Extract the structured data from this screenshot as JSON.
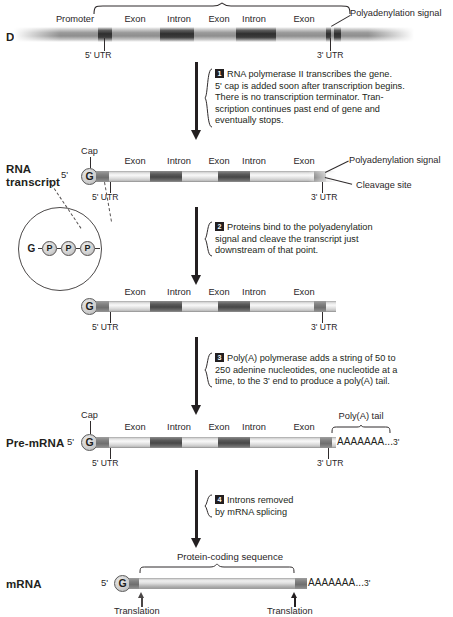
{
  "diagram": {
    "rows": [
      {
        "name": "dna",
        "label": "DNA",
        "segments": [
          "Promoter",
          "Exon",
          "Intron",
          "Exon",
          "Intron",
          "Exon"
        ],
        "utr5": "5' UTR",
        "utr3": "3' UTR",
        "callout_polyA": "Polyadenylation signal"
      },
      {
        "name": "rna-transcript",
        "label_line1": "RNA",
        "label_line2": "transcript",
        "cap_label": "Cap",
        "cap_letter": "G",
        "five_prime": "5'",
        "segments": [
          "Exon",
          "Intron",
          "Exon",
          "Intron",
          "Exon"
        ],
        "utr5": "5' UTR",
        "utr3": "3' UTR",
        "callout_polyA": "Polyadenylation signal",
        "callout_cleavage": "Cleavage site",
        "inset": [
          "G",
          "P",
          "P",
          "P"
        ]
      },
      {
        "name": "cleaved-transcript",
        "label": "",
        "cap_letter": "G",
        "segments": [
          "Exon",
          "Intron",
          "Exon",
          "Intron",
          "Exon"
        ],
        "utr5": "5' UTR",
        "utr3": "3' UTR"
      },
      {
        "name": "pre-mrna",
        "label": "Pre-mRNA",
        "cap_label": "Cap",
        "cap_letter": "G",
        "five_prime": "5'",
        "segments": [
          "Exon",
          "Intron",
          "Exon",
          "Intron",
          "Exon"
        ],
        "utr5": "5' UTR",
        "utr3": "3' UTR",
        "polya_brace_label": "Poly(A) tail",
        "polya_tail": "AAAAAAA...",
        "three_prime": "3'"
      },
      {
        "name": "mrna",
        "label": "mRNA",
        "cap_letter": "G",
        "five_prime": "5'",
        "brace_label": "Protein-coding sequence",
        "polya_tail": "AAAAAAA...",
        "three_prime": "3'",
        "translation_left": "Translation",
        "translation_right": "Translation"
      }
    ],
    "steps": [
      {
        "number": "1",
        "lines": [
          "RNA polymerase II transcribes the gene.",
          "5' cap is added soon after transcription begins.",
          "There is no transcription terminator. Tran-",
          "scription continues past end of gene and",
          "eventually stops."
        ]
      },
      {
        "number": "2",
        "lines": [
          "Proteins bind to the polyadenylation",
          "signal and cleave the transcript just",
          "downstream of that point."
        ]
      },
      {
        "number": "3",
        "lines": [
          "Poly(A) polymerase adds a string of 50 to",
          "250 adenine nucleotides, one nucleotide at a",
          "time, to the 3' end to produce a poly(A) tail."
        ]
      },
      {
        "number": "4",
        "lines": [
          "Introns removed",
          "by mRNA splicing"
        ]
      }
    ],
    "colors": {
      "ink": "#231f20",
      "intron": "#4b4b4b",
      "exon": "#eeeeee",
      "utr": "#7e7e7e",
      "background": "#ffffff"
    }
  }
}
